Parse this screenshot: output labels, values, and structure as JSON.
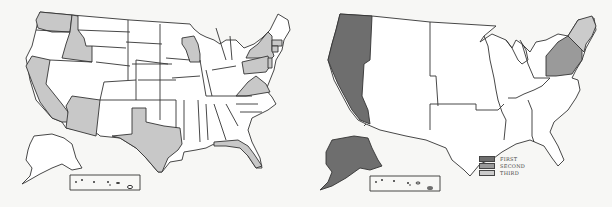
{
  "colors": {
    "background": "#f7f7f5",
    "unfilled": "#ffffff",
    "left_highlight": "#c8c8c8",
    "first": "#6e6e6e",
    "second": "#9a9a9a",
    "third": "#cbcbcb",
    "stroke": "#333333"
  },
  "left_map": {
    "description": "US states map with highlighted states",
    "highlighted_states": [
      "Washington",
      "Idaho",
      "California",
      "Arizona",
      "Texas",
      "Wisconsin",
      "New York",
      "Pennsylvania",
      "Virginia",
      "Florida",
      "Massachusetts",
      "Connecticut",
      "New Jersey"
    ]
  },
  "right_map": {
    "description": "US regions map",
    "regions": [
      {
        "name": "Pacific",
        "rank": "FIRST"
      },
      {
        "name": "Alaska",
        "rank": "FIRST"
      },
      {
        "name": "Mid-Atlantic",
        "rank": "SECOND"
      },
      {
        "name": "New England",
        "rank": "THIRD"
      }
    ]
  },
  "legend": {
    "items": [
      {
        "label": "FIRST",
        "color": "#6e6e6e"
      },
      {
        "label": "SECOND",
        "color": "#9a9a9a"
      },
      {
        "label": "THIRD",
        "color": "#cbcbcb"
      }
    ]
  }
}
